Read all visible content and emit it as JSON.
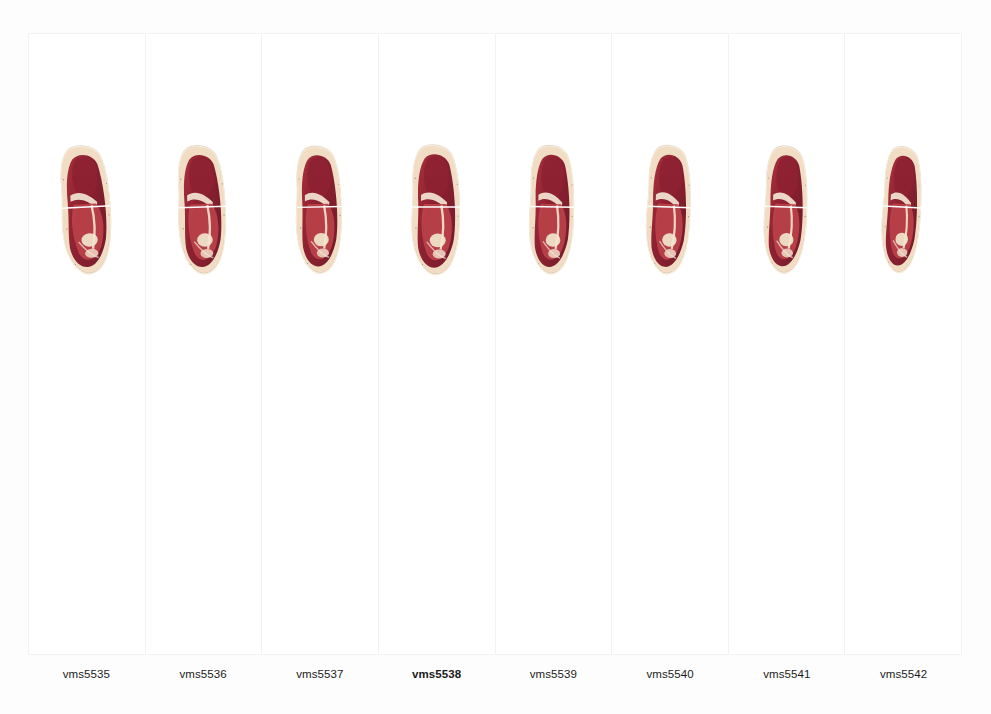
{
  "figure": {
    "background_color": "#fdfdfd",
    "panel_background": "#ffffff",
    "panel_border_color": "#f2f2f3",
    "label_color": "#1b1b1b"
  },
  "colors": {
    "fat_rind": "#f0ddc4",
    "fat_rind_light": "#f7ead8",
    "muscle_dark": "#8e2232",
    "muscle_mid": "#a8303c",
    "muscle_light": "#b9414a",
    "muscle_deep": "#7a1d2c",
    "intramuscular_fat": "#f3e6d2",
    "bone": "#efe2cb",
    "rind_speckle": "#6d5a46",
    "measurement_line": "#ffffff"
  },
  "measurement_line": {
    "name": "horizontal-reference-line",
    "color": "#ffffff",
    "thickness_px": 2,
    "y_fraction": 0.52
  },
  "panels": [
    {
      "id": "vms5535",
      "label": "vms5535",
      "highlighted": false,
      "lean_deg": -3,
      "scale_x": 1.0,
      "scale_y": 1.0
    },
    {
      "id": "vms5536",
      "label": "vms5536",
      "highlighted": false,
      "lean_deg": -2,
      "scale_x": 0.98,
      "scale_y": 1.0
    },
    {
      "id": "vms5537",
      "label": "vms5537",
      "highlighted": false,
      "lean_deg": -1,
      "scale_x": 0.96,
      "scale_y": 0.99
    },
    {
      "id": "vms5538",
      "label": "vms5538",
      "highlighted": true,
      "lean_deg": 0,
      "scale_x": 0.99,
      "scale_y": 1.01
    },
    {
      "id": "vms5539",
      "label": "vms5539",
      "highlighted": false,
      "lean_deg": 1,
      "scale_x": 0.95,
      "scale_y": 1.0
    },
    {
      "id": "vms5540",
      "label": "vms5540",
      "highlighted": false,
      "lean_deg": 2,
      "scale_x": 0.94,
      "scale_y": 1.0
    },
    {
      "id": "vms5541",
      "label": "vms5541",
      "highlighted": false,
      "lean_deg": 2,
      "scale_x": 0.93,
      "scale_y": 0.99
    },
    {
      "id": "vms5542",
      "label": "vms5542",
      "highlighted": false,
      "lean_deg": 3,
      "scale_x": 0.88,
      "scale_y": 0.98
    }
  ]
}
